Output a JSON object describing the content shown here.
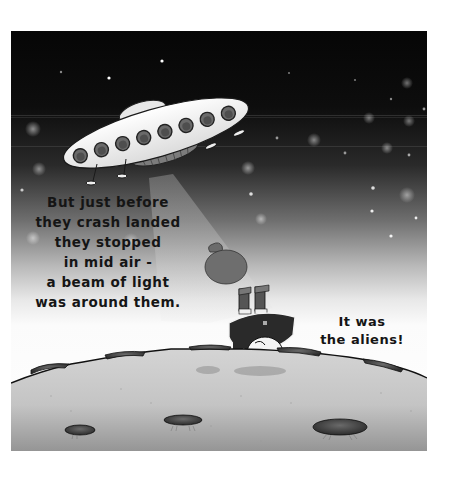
{
  "illustration": {
    "description": "Picture-book illustration: a tilted flying saucer in a starry night sky shines a beam of light down onto a cratered moon surface; a small figure in a dark outfit floats upside-down in the beam with a sack above and a banana nearby",
    "colors": {
      "sky_top": "#060606",
      "sky_mid": "#6e6e6e",
      "sky_bottom": "#ffffff",
      "ground_light": "#d2d2d2",
      "ground_dark": "#9a9a9a",
      "ufo_body": "#f4f4f4",
      "ufo_window": "#6a6a6a",
      "beam": "#c8c8c8",
      "text": "#151515"
    }
  },
  "captions": {
    "narration": {
      "lines": [
        "But just before",
        "they crash landed",
        "they stopped",
        "in mid air -",
        "a beam of light",
        "was around them."
      ]
    },
    "reveal": {
      "lines": [
        "It was",
        "the aliens!"
      ]
    }
  }
}
